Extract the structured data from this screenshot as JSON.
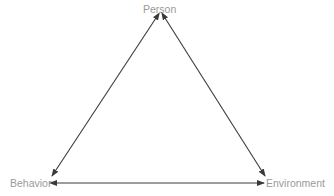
{
  "diagram": {
    "type": "triadic reciprocal causation triangle",
    "nodes": {
      "person": "Person",
      "behavior": "Behavior",
      "environment": "Environment"
    },
    "edges": [
      {
        "from": "Person",
        "to": "Behavior",
        "style": "bidirectional-arrow"
      },
      {
        "from": "Person",
        "to": "Environment",
        "style": "bidirectional-arrow"
      },
      {
        "from": "Behavior",
        "to": "Environment",
        "style": "bidirectional-arrow"
      }
    ],
    "colors": {
      "label": "#9a9a9a",
      "arrow": "#3a3a3a",
      "background": "#ffffff"
    }
  }
}
